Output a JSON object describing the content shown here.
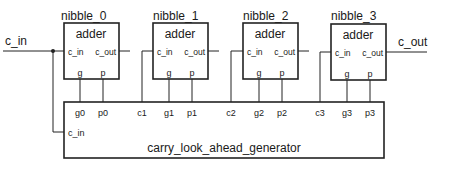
{
  "diagram": {
    "type": "block-diagram",
    "input_label": "c_in",
    "output_label": "c_out",
    "nibbles": [
      {
        "instance": "nibble_0",
        "component": "adder",
        "port_cin": "c_in",
        "port_cout": "c_out",
        "port_g": "g",
        "port_p": "p"
      },
      {
        "instance": "nibble_1",
        "component": "adder",
        "port_cin": "c_in",
        "port_cout": "c_out",
        "port_g": "g",
        "port_p": "p"
      },
      {
        "instance": "nibble_2",
        "component": "adder",
        "port_cin": "c_in",
        "port_cout": "c_out",
        "port_g": "g",
        "port_p": "p"
      },
      {
        "instance": "nibble_3",
        "component": "adder",
        "port_cin": "c_in",
        "port_cout": "c_out",
        "port_g": "g",
        "port_p": "p"
      }
    ],
    "generator": {
      "name": "carry_look_ahead_generator",
      "port_cin": "c_in",
      "ports": [
        "g0",
        "p0",
        "c1",
        "g1",
        "p1",
        "c2",
        "g2",
        "p2",
        "c3",
        "g3",
        "p3"
      ]
    }
  }
}
